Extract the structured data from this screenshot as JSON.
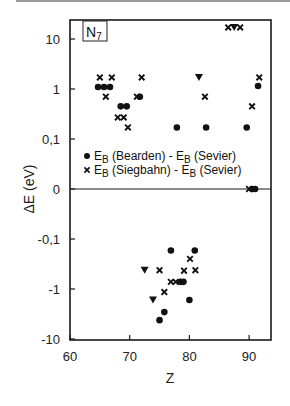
{
  "chart_data": {
    "type": "scatter",
    "title": "",
    "panel_label": "N",
    "panel_label_sub": "7",
    "xlabel": "Z",
    "ylabel": "ΔE (eV)",
    "xlim": [
      60,
      93.7
    ],
    "x_ticks": [
      60,
      70,
      80,
      90
    ],
    "y_scale": "symlog (log positive / zero / log negative)",
    "y_ticks": [
      {
        "label": "10",
        "value": 10
      },
      {
        "label": "1",
        "value": 1
      },
      {
        "label": "0,1",
        "value": 0.1
      },
      {
        "label": "0",
        "value": 0
      },
      {
        "label": "-0,1",
        "value": -0.1
      },
      {
        "label": "-1",
        "value": -1
      },
      {
        "label": "-10",
        "value": -10
      }
    ],
    "zero_line": true,
    "grid": false,
    "legend_position": "upper center, inside plot",
    "series": [
      {
        "name": "E_B (Bearden) - E_B (Sevier)",
        "marker": "circle",
        "points": [
          [
            64.7,
            1.1
          ],
          [
            65.7,
            1.1
          ],
          [
            66.7,
            1.1
          ],
          [
            68.5,
            0.45
          ],
          [
            69.5,
            0.45
          ],
          [
            71.7,
            0.7
          ],
          [
            77.9,
            0.17
          ],
          [
            82.8,
            0.17
          ],
          [
            89.6,
            0.17
          ],
          [
            91.5,
            1.15
          ],
          [
            90.5,
            0
          ],
          [
            91.0,
            0
          ],
          [
            76.9,
            -0.17
          ],
          [
            80.9,
            -0.17
          ],
          [
            78.5,
            -0.72
          ],
          [
            79.0,
            -0.72
          ],
          [
            80.0,
            -1.66
          ],
          [
            75.8,
            -2.9
          ],
          [
            75.0,
            -4.2
          ]
        ]
      },
      {
        "name": "E_B (Siegbahn) - E_B (Sevier)",
        "marker": "x",
        "points": [
          [
            65.0,
            1.7
          ],
          [
            67.0,
            1.7
          ],
          [
            72.0,
            1.7
          ],
          [
            66.0,
            0.7
          ],
          [
            71.2,
            0.7
          ],
          [
            68.0,
            0.27
          ],
          [
            69.0,
            0.27
          ],
          [
            69.7,
            0.17
          ],
          [
            86.5,
            17
          ],
          [
            88.5,
            17
          ],
          [
            82.6,
            0.7
          ],
          [
            91.7,
            1.7
          ],
          [
            90.5,
            0.45
          ],
          [
            90.0,
            0
          ],
          [
            80.1,
            -0.25
          ],
          [
            75.0,
            -0.42
          ],
          [
            79.1,
            -0.43
          ],
          [
            81.0,
            -0.42
          ],
          [
            76.9,
            -0.72
          ],
          [
            77.7,
            -0.72
          ],
          [
            75.8,
            -1.15
          ]
        ]
      },
      {
        "name": "unlabeled (triangle)",
        "marker": "triangle-down",
        "points": [
          [
            87.5,
            17
          ],
          [
            81.6,
            1.7
          ],
          [
            72.5,
            -0.42
          ],
          [
            73.9,
            -1.66
          ]
        ]
      }
    ]
  },
  "legend": {
    "items": [
      {
        "symbol": "●",
        "prefix": "E",
        "sub": "B",
        "middle": " (Bearden) -   E",
        "sub2": "B",
        "suffix": " (Sevier)"
      },
      {
        "symbol": "x",
        "prefix": "E",
        "sub": "B",
        "middle": " (Siegbahn) - E",
        "sub2": "B",
        "suffix": " (Sevier)"
      }
    ]
  },
  "colors": {
    "ink": "#111111",
    "axis": "#1a1a1a",
    "top_rule": "#9a9a9a"
  }
}
